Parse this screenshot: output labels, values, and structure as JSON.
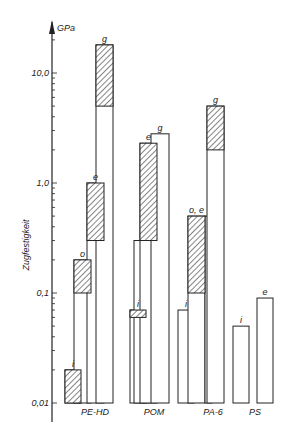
{
  "chart_data": {
    "type": "bar",
    "title": "",
    "xlabel": "",
    "ylabel": "Zugfestigkeit",
    "yunit": "GPa",
    "yscale": "log",
    "ylim": [
      0.008,
      20
    ],
    "yticks": [
      {
        "value": 10.0,
        "label": "10,0"
      },
      {
        "value": 1.0,
        "label": "1,0"
      },
      {
        "value": 0.1,
        "label": "0,1"
      },
      {
        "value": 0.01,
        "label": "0,01"
      }
    ],
    "grid": false,
    "legend": null,
    "hatch_meaning": "hatched segment shows range (lower–upper)",
    "groups": [
      {
        "name": "PE-HD",
        "bars": [
          {
            "label": "i",
            "value": 0.02,
            "hatch_low": 0.01
          },
          {
            "label": "o",
            "value": 0.2,
            "hatch_low": 0.1
          },
          {
            "label": "e",
            "value": 1.0,
            "hatch_low": 0.3
          },
          {
            "label": "g",
            "value": 18.0,
            "hatch_low": 5.0
          }
        ]
      },
      {
        "name": "POM",
        "bars": [
          {
            "label": "i",
            "value": 0.07,
            "hatch_low": 0.06
          },
          {
            "label": "o",
            "value": 0.3,
            "hatch_low": null
          },
          {
            "label": "e",
            "value": 2.3,
            "hatch_low": 0.3
          },
          {
            "label": "g",
            "value": 2.8,
            "hatch_low": null
          }
        ]
      },
      {
        "name": "PA-6",
        "bars": [
          {
            "label": "i",
            "value": 0.07,
            "hatch_low": null
          },
          {
            "label": "o, e",
            "value": 0.5,
            "hatch_low": 0.1
          },
          {
            "label": "",
            "value": 0.5,
            "hatch_low": null
          },
          {
            "label": "g",
            "value": 5.0,
            "hatch_low": 2.0
          }
        ]
      },
      {
        "name": "PS",
        "bars": [
          {
            "label": "i",
            "value": 0.05,
            "hatch_low": null
          },
          {
            "label": "e",
            "value": 0.09,
            "hatch_low": null
          }
        ]
      }
    ]
  },
  "axis": {
    "unit_label": "GPa",
    "title": "Zugfestigkeit"
  },
  "category_labels": [
    "PE-HD",
    "POM",
    "PA-6",
    "PS"
  ]
}
